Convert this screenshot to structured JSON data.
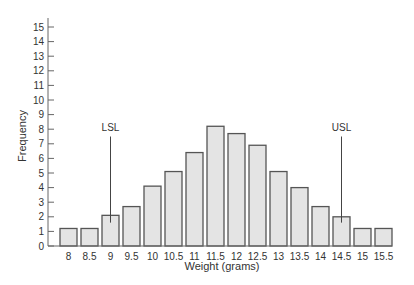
{
  "chart_data": {
    "type": "bar",
    "title": "",
    "xlabel": "Weight (grams)",
    "ylabel": "Frequency",
    "categories": [
      "8",
      "8.5",
      "9",
      "9.5",
      "10",
      "10.5",
      "11",
      "11.5",
      "12",
      "12.5",
      "13",
      "13.5",
      "14",
      "14.5",
      "15",
      "15.5"
    ],
    "values": [
      1.2,
      1.2,
      2.1,
      2.7,
      4.1,
      5.1,
      6.4,
      8.2,
      7.7,
      6.9,
      5.1,
      4.0,
      2.7,
      2.0,
      1.2,
      1.2
    ],
    "ylim": [
      0,
      15
    ],
    "yticks": [
      0,
      1,
      2,
      3,
      4,
      5,
      6,
      7,
      8,
      9,
      10,
      11,
      12,
      13,
      14,
      15
    ],
    "grid": false,
    "legend": null,
    "annotations": [
      {
        "label": "LSL",
        "x": "9",
        "line_from": 1.6,
        "line_to": 7.5
      },
      {
        "label": "USL",
        "x": "14.5",
        "line_from": 1.6,
        "line_to": 7.5
      }
    ]
  }
}
